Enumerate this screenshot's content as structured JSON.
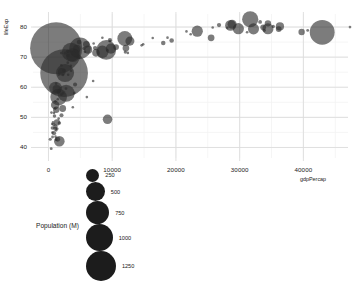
{
  "chart_data": {
    "type": "scatter",
    "title": "",
    "xlabel": "gdpPercap",
    "ylabel": "lifeExp",
    "xlim": [
      -1800,
      47000
    ],
    "ylim": [
      36.5,
      83
    ],
    "xticks": [
      0,
      10000,
      20000,
      30000,
      40000
    ],
    "xtick_labels": [
      "0",
      "10000",
      "20000",
      "30000",
      "40000"
    ],
    "yticks": [
      40,
      50,
      60,
      70,
      80
    ],
    "ytick_labels": [
      "40",
      "50",
      "60",
      "70",
      "80"
    ],
    "grid": true,
    "minor_grid": true,
    "legend_position": "bottom",
    "size_legend": {
      "title": "Population (M)",
      "values": [
        250,
        500,
        750,
        1000,
        1250
      ],
      "labels": [
        "250",
        "500",
        "750",
        "1000",
        "1250"
      ]
    },
    "bubble_color": "#2b2b2b",
    "bubble_opacity": 0.62,
    "size_encoding": "population in millions, area-proportional",
    "points": [
      {
        "x": 1202,
        "y": 72.96,
        "pop": 1318
      },
      {
        "x": 2452,
        "y": 64.7,
        "pop": 1110
      },
      {
        "x": 4959,
        "y": 72.96,
        "pop": 223
      },
      {
        "x": 42952,
        "y": 78.24,
        "pop": 301
      },
      {
        "x": 9065,
        "y": 72.39,
        "pop": 190
      },
      {
        "x": 3540,
        "y": 71.69,
        "pop": 166
      },
      {
        "x": 2602,
        "y": 64.7,
        "pop": 158
      },
      {
        "x": 1593,
        "y": 56.73,
        "pop": 135
      },
      {
        "x": 31656,
        "y": 82.6,
        "pop": 127
      },
      {
        "x": 2769,
        "y": 58.02,
        "pop": 143
      },
      {
        "x": 11978,
        "y": 76.2,
        "pop": 108
      },
      {
        "x": 3822,
        "y": 70.65,
        "pop": 91
      },
      {
        "x": 1107,
        "y": 59.72,
        "pop": 80
      },
      {
        "x": 8458,
        "y": 71.78,
        "pop": 74
      },
      {
        "x": 23348,
        "y": 78.62,
        "pop": 61
      },
      {
        "x": 29796,
        "y": 79.44,
        "pop": 61
      },
      {
        "x": 32170,
        "y": 79.4,
        "pop": 60
      },
      {
        "x": 28569,
        "y": 80.55,
        "pop": 58
      },
      {
        "x": 1704,
        "y": 42.08,
        "pop": 55
      },
      {
        "x": 9786,
        "y": 72.8,
        "pop": 51
      },
      {
        "x": 9269,
        "y": 49.34,
        "pop": 44
      },
      {
        "x": 28821,
        "y": 80.94,
        "pop": 40
      },
      {
        "x": 12779,
        "y": 75.32,
        "pop": 40
      },
      {
        "x": 36319,
        "y": 80.2,
        "pop": 33
      },
      {
        "x": 7454,
        "y": 71.42,
        "pop": 28
      },
      {
        "x": 4471,
        "y": 72.9,
        "pop": 27
      },
      {
        "x": 2082,
        "y": 65.15,
        "pop": 28
      },
      {
        "x": 4184,
        "y": 71.34,
        "pop": 24
      },
      {
        "x": 34435,
        "y": 79.43,
        "pop": 60
      },
      {
        "x": 1056,
        "y": 54.11,
        "pop": 35
      },
      {
        "x": 1271,
        "y": 59.45,
        "pop": 31
      },
      {
        "x": 6223,
        "y": 72.48,
        "pop": 33
      },
      {
        "x": 34435,
        "y": 81.23,
        "pop": 20
      },
      {
        "x": 12154,
        "y": 73.0,
        "pop": 22
      },
      {
        "x": 25523,
        "y": 76.42,
        "pop": 22
      },
      {
        "x": 19329,
        "y": 75.56,
        "pop": 10
      },
      {
        "x": 1217,
        "y": 52.52,
        "pop": 20
      },
      {
        "x": 2227,
        "y": 52.95,
        "pop": 23
      },
      {
        "x": 5937,
        "y": 74.24,
        "pop": 21
      },
      {
        "x": 39725,
        "y": 78.33,
        "pop": 20
      },
      {
        "x": 10611,
        "y": 73.34,
        "pop": 16
      },
      {
        "x": 1328,
        "y": 48.3,
        "pop": 19
      },
      {
        "x": 1441,
        "y": 42.73,
        "pop": 12
      },
      {
        "x": 4811,
        "y": 74.99,
        "pop": 11
      },
      {
        "x": 36126,
        "y": 79.31,
        "pop": 16
      },
      {
        "x": 33693,
        "y": 79.91,
        "pop": 16
      },
      {
        "x": 47307,
        "y": 79.97,
        "pop": 4
      },
      {
        "x": 18009,
        "y": 74.66,
        "pop": 10
      },
      {
        "x": 1091,
        "y": 46.86,
        "pop": 10
      },
      {
        "x": 863,
        "y": 44.74,
        "pop": 9
      },
      {
        "x": 7320,
        "y": 73.01,
        "pop": 9
      },
      {
        "x": 9645,
        "y": 75.64,
        "pop": 9
      },
      {
        "x": 26765,
        "y": 80.65,
        "pop": 9
      },
      {
        "x": 33207,
        "y": 81.7,
        "pop": 7
      },
      {
        "x": 4172,
        "y": 60.92,
        "pop": 8
      },
      {
        "x": 2042,
        "y": 50.73,
        "pop": 8
      },
      {
        "x": 1056,
        "y": 46.24,
        "pop": 8
      },
      {
        "x": 1598,
        "y": 58.56,
        "pop": 8
      },
      {
        "x": 2441,
        "y": 65.55,
        "pop": 6
      },
      {
        "x": 12057,
        "y": 71.69,
        "pop": 5
      },
      {
        "x": 3025,
        "y": 71.99,
        "pop": 6
      },
      {
        "x": 40676,
        "y": 78.88,
        "pop": 4
      },
      {
        "x": 35278,
        "y": 80.2,
        "pop": 5
      },
      {
        "x": 33859,
        "y": 78.89,
        "pop": 5
      },
      {
        "x": 5581,
        "y": 72.9,
        "pop": 5
      },
      {
        "x": 1212,
        "y": 42.59,
        "pop": 4
      },
      {
        "x": 641,
        "y": 43.49,
        "pop": 4
      },
      {
        "x": 430,
        "y": 39.61,
        "pop": 4
      },
      {
        "x": 277,
        "y": 42.73,
        "pop": 5
      },
      {
        "x": 823,
        "y": 47.62,
        "pop": 5
      },
      {
        "x": 619,
        "y": 46.46,
        "pop": 6
      },
      {
        "x": 944,
        "y": 50.43,
        "pop": 6
      },
      {
        "x": 1713,
        "y": 48.16,
        "pop": 6
      },
      {
        "x": 1107,
        "y": 43.59,
        "pop": 3
      },
      {
        "x": 1217,
        "y": 45.68,
        "pop": 3
      },
      {
        "x": 2280,
        "y": 58.04,
        "pop": 3
      },
      {
        "x": 3095,
        "y": 64.16,
        "pop": 3
      },
      {
        "x": 8458,
        "y": 76.42,
        "pop": 2
      },
      {
        "x": 18678,
        "y": 76.48,
        "pop": 2
      },
      {
        "x": 7092,
        "y": 74.54,
        "pop": 2
      },
      {
        "x": 4056,
        "y": 58.13,
        "pop": 2
      },
      {
        "x": 9666,
        "y": 75.32,
        "pop": 2
      },
      {
        "x": 3095,
        "y": 70.62,
        "pop": 2
      },
      {
        "x": 2013,
        "y": 67.3,
        "pop": 2
      },
      {
        "x": 2607,
        "y": 71.33,
        "pop": 2
      },
      {
        "x": 1463,
        "y": 56.01,
        "pop": 2
      },
      {
        "x": 2280,
        "y": 64.06,
        "pop": 2
      },
      {
        "x": 12451,
        "y": 71.41,
        "pop": 1
      },
      {
        "x": 14619,
        "y": 73.92,
        "pop": 1
      },
      {
        "x": 25768,
        "y": 79.83,
        "pop": 1
      },
      {
        "x": 21654,
        "y": 78.55,
        "pop": 1
      },
      {
        "x": 14855,
        "y": 74.24,
        "pop": 1
      },
      {
        "x": 31164,
        "y": 78.27,
        "pop": 1
      },
      {
        "x": 9253,
        "y": 72.24,
        "pop": 1
      },
      {
        "x": 5728,
        "y": 71.75,
        "pop": 1
      },
      {
        "x": 3548,
        "y": 65.49,
        "pop": 1
      },
      {
        "x": 1056,
        "y": 52.91,
        "pop": 1
      },
      {
        "x": 706,
        "y": 48.33,
        "pop": 1
      },
      {
        "x": 579,
        "y": 47.79,
        "pop": 1
      },
      {
        "x": 469,
        "y": 51.58,
        "pop": 1
      },
      {
        "x": 1091,
        "y": 55.32,
        "pop": 1
      },
      {
        "x": 3820,
        "y": 53.37,
        "pop": 1
      },
      {
        "x": 6025,
        "y": 56.73,
        "pop": 1
      },
      {
        "x": 7008,
        "y": 62.07,
        "pop": 2
      },
      {
        "x": 2749,
        "y": 59.55,
        "pop": 2
      },
      {
        "x": 1598,
        "y": 49.58,
        "pop": 1
      },
      {
        "x": 863,
        "y": 51.46,
        "pop": 1
      },
      {
        "x": 619,
        "y": 44.97,
        "pop": 1
      },
      {
        "x": 1381,
        "y": 46.24,
        "pop": 1
      },
      {
        "x": 2016,
        "y": 57.56,
        "pop": 1
      },
      {
        "x": 3505,
        "y": 67.1,
        "pop": 1
      },
      {
        "x": 4797,
        "y": 69.8,
        "pop": 1
      },
      {
        "x": 16361,
        "y": 76.38,
        "pop": 1
      },
      {
        "x": 22316,
        "y": 77.59,
        "pop": 1
      },
      {
        "x": 28061,
        "y": 79.76,
        "pop": 1
      },
      {
        "x": 2013,
        "y": 71.34,
        "pop": 1
      },
      {
        "x": 1201,
        "y": 61.19,
        "pop": 1
      },
      {
        "x": 1598,
        "y": 64.16,
        "pop": 1
      },
      {
        "x": 3025,
        "y": 68.17,
        "pop": 1
      }
    ]
  }
}
